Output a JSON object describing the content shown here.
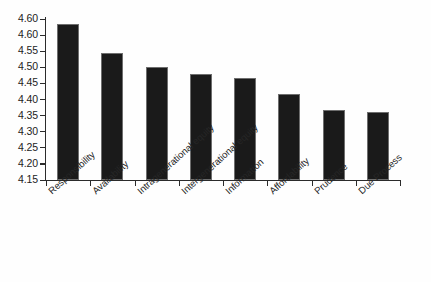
{
  "chart_data": {
    "type": "bar",
    "title": "",
    "subtitle": "",
    "xlabel": "",
    "ylabel": "",
    "ylim": [
      4.15,
      4.6
    ],
    "grid": false,
    "legend": false,
    "orientation": "vertical",
    "bar_color": "#1a1a1a",
    "categories": [
      "Responsibility",
      "Availability",
      "Intragenerational equity",
      "Intergenerational equity",
      "Information",
      "Affordability",
      "Prudence",
      "Due Process"
    ],
    "values": [
      4.585,
      4.505,
      4.465,
      4.445,
      4.435,
      4.39,
      4.345,
      4.34
    ],
    "ytick_labels": [
      "4.60",
      "4.60",
      "4.55",
      "4.50",
      "4.45",
      "4.40",
      "4.35",
      "4.30",
      "4.25",
      "4.20",
      "4.15"
    ],
    "ytick_values": [
      4.6,
      4.595,
      4.55,
      4.5,
      4.45,
      4.4,
      4.35,
      4.3,
      4.25,
      4.2,
      4.15
    ]
  },
  "colors": {
    "bar": "#1a1a1a",
    "axis": "#2b2b2b",
    "text": "#1c1c1c",
    "background": "#fefefe"
  }
}
